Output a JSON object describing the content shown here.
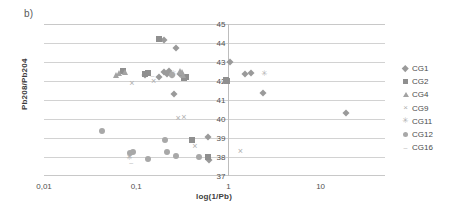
{
  "figure": {
    "panel_label": "b)"
  },
  "chart_data": {
    "type": "scatter",
    "title": "",
    "xlabel": "log(1/Pb)",
    "ylabel": "Pb208/Pb204",
    "xscale": "log",
    "xlim": [
      0.01,
      50
    ],
    "ylim": [
      37,
      45
    ],
    "yticks": [
      "45",
      "44",
      "43",
      "42",
      "41",
      "40",
      "39",
      "38",
      "37"
    ],
    "ytick_values": [
      45,
      44,
      43,
      42,
      41,
      40,
      39,
      38,
      37
    ],
    "xticks": [
      "0,01",
      "0,1",
      "1",
      "10"
    ],
    "xtick_values": [
      0.01,
      0.1,
      1,
      10
    ],
    "grid": "horizontal",
    "legend_position": "right",
    "marker_color": "#9a9a9a",
    "grid_color": "#d2d2d2",
    "axis_color": "#bdbdbd",
    "series": [
      {
        "name": "CG1",
        "marker": "diamond",
        "color": "#9a9a9a",
        "points": [
          [
            0.2,
            44.15
          ],
          [
            0.27,
            43.72
          ],
          [
            0.125,
            42.3
          ],
          [
            0.175,
            42.22
          ],
          [
            0.2,
            42.45
          ],
          [
            0.215,
            42.38
          ],
          [
            0.225,
            42.52
          ],
          [
            0.245,
            42.3
          ],
          [
            0.3,
            42.38
          ],
          [
            0.255,
            41.3
          ],
          [
            1.05,
            43.0
          ],
          [
            1.5,
            42.35
          ],
          [
            1.75,
            42.4
          ],
          [
            2.4,
            41.35
          ],
          [
            19.0,
            40.3
          ],
          [
            0.6,
            39.05
          ],
          [
            0.62,
            37.85
          ]
        ]
      },
      {
        "name": "CG2",
        "marker": "square",
        "color": "#8f8f8f",
        "points": [
          [
            0.175,
            44.22
          ],
          [
            0.072,
            42.55
          ],
          [
            0.125,
            42.35
          ],
          [
            0.135,
            42.4
          ],
          [
            0.33,
            42.18
          ],
          [
            0.345,
            42.22
          ],
          [
            0.4,
            38.88
          ],
          [
            0.6,
            38.02
          ],
          [
            0.95,
            42.08
          ],
          [
            0.97,
            42.02
          ]
        ]
      },
      {
        "name": "CG4",
        "marker": "triangle",
        "color": "#a3a3a3",
        "points": [
          [
            0.06,
            42.32
          ],
          [
            0.065,
            42.4
          ],
          [
            0.075,
            42.48
          ],
          [
            0.3,
            42.52
          ],
          [
            0.31,
            42.45
          ],
          [
            0.32,
            42.3
          ]
        ]
      },
      {
        "name": "CG9",
        "marker": "x",
        "color": "#b0b0b0",
        "points": [
          [
            0.09,
            41.92
          ],
          [
            0.155,
            41.98
          ],
          [
            0.285,
            40.05
          ],
          [
            0.33,
            40.12
          ],
          [
            0.435,
            38.58
          ],
          [
            1.35,
            38.3
          ],
          [
            0.085,
            38.05
          ]
        ]
      },
      {
        "name": "CG11",
        "marker": "star",
        "color": "#b4b4b4",
        "points": [
          [
            0.085,
            38.02
          ],
          [
            0.255,
            42.42
          ],
          [
            2.45,
            42.4
          ]
        ]
      },
      {
        "name": "CG12",
        "marker": "circle",
        "color": "#a8a8a8",
        "points": [
          [
            0.042,
            39.35
          ],
          [
            0.085,
            38.2
          ],
          [
            0.092,
            38.25
          ],
          [
            0.135,
            37.92
          ],
          [
            0.205,
            38.88
          ],
          [
            0.215,
            38.25
          ],
          [
            0.27,
            38.05
          ],
          [
            0.48,
            37.98
          ],
          [
            0.245,
            42.3
          ]
        ]
      },
      {
        "name": "CG16",
        "marker": "dash",
        "color": "#bcbcbc",
        "points": [
          [
            0.088,
            37.72
          ],
          [
            0.15,
            42.3
          ]
        ]
      }
    ]
  },
  "legend": {
    "items": [
      {
        "label": "CG1",
        "marker": "diamond"
      },
      {
        "label": "CG2",
        "marker": "square"
      },
      {
        "label": "CG4",
        "marker": "triangle"
      },
      {
        "label": "CG9",
        "marker": "x"
      },
      {
        "label": "CG11",
        "marker": "star"
      },
      {
        "label": "CG12",
        "marker": "circle"
      },
      {
        "label": "CG16",
        "marker": "dash"
      }
    ]
  }
}
